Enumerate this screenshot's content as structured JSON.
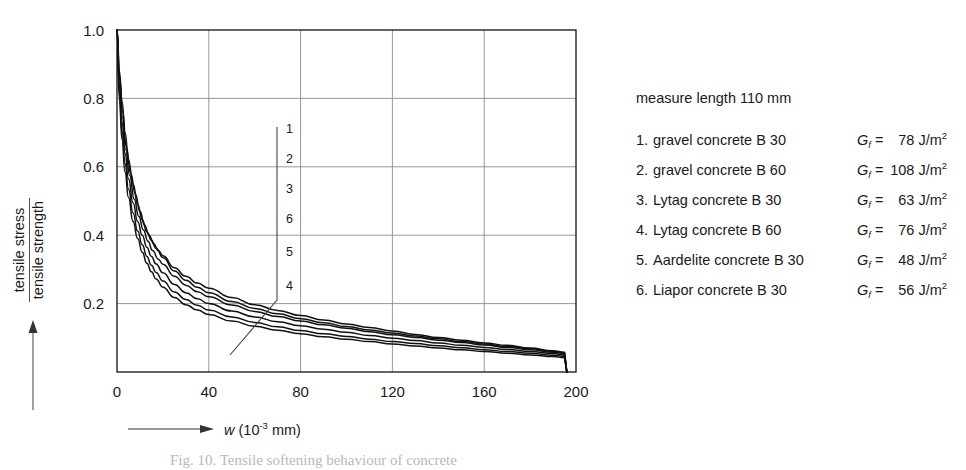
{
  "figure": {
    "caption": "Fig. 10.  Tensile softening behaviour of concrete"
  },
  "legend": {
    "title": "measure length 110 mm",
    "gf_symbol": "G",
    "gf_subscript": "f",
    "gf_equals": "=",
    "gf_unit": "J/m",
    "gf_unit_exponent": "2",
    "items": [
      {
        "index": "1.",
        "label": "gravel concrete B 30",
        "gf": "78"
      },
      {
        "index": "2.",
        "label": "gravel concrete B 60",
        "gf": "108"
      },
      {
        "index": "3.",
        "label": "Lytag concrete B 30",
        "gf": "63"
      },
      {
        "index": "4.",
        "label": "Lytag concrete B 60",
        "gf": "76"
      },
      {
        "index": "5.",
        "label": "Aardelite concrete B 30",
        "gf": "48"
      },
      {
        "index": "6.",
        "label": "Liapor concrete B 30",
        "gf": "56"
      }
    ]
  },
  "axes": {
    "y_label_numerator": "tensile stress",
    "y_label_denominator": "tensile strength",
    "x_label_variable": "w",
    "x_label_unit_open": "(10",
    "x_label_exponent": "-3",
    "x_label_unit_close": " mm)"
  },
  "chart_data": {
    "type": "line",
    "title": "",
    "xlabel": "w (10^-3 mm)",
    "ylabel": "tensile stress / tensile strength",
    "xlim": [
      0,
      200
    ],
    "ylim": [
      0,
      1.0
    ],
    "xticks": [
      0,
      40,
      80,
      120,
      160,
      200
    ],
    "yticks": [
      0.2,
      0.4,
      0.6,
      0.8,
      1.0
    ],
    "ytick_labels": [
      "0.2",
      "0.4",
      "0.6",
      "0.8",
      "1.0"
    ],
    "xtick_labels": [
      "0",
      "40",
      "80",
      "120",
      "160",
      "200"
    ],
    "grid": true,
    "legend_position": "right-outside",
    "line_color": "#111111",
    "grid_color": "#8c8c8c",
    "axis_color": "#111111",
    "curve_callout": {
      "order_top_to_bottom": [
        "1",
        "2",
        "3",
        "6",
        "5",
        "4"
      ],
      "leader_line": "vertical with diagonal foot"
    },
    "series": [
      {
        "name": "1. gravel concrete B 30",
        "points": [
          [
            0,
            1.0
          ],
          [
            1.2,
            0.86
          ],
          [
            2.5,
            0.76
          ],
          [
            4,
            0.66
          ],
          [
            6,
            0.58
          ],
          [
            8,
            0.52
          ],
          [
            10,
            0.47
          ],
          [
            12,
            0.43
          ],
          [
            14,
            0.4
          ],
          [
            16,
            0.375
          ],
          [
            18,
            0.355
          ],
          [
            20,
            0.34
          ],
          [
            25,
            0.305
          ],
          [
            30,
            0.28
          ],
          [
            35,
            0.26
          ],
          [
            40,
            0.245
          ],
          [
            50,
            0.218
          ],
          [
            60,
            0.197
          ],
          [
            70,
            0.18
          ],
          [
            80,
            0.165
          ],
          [
            90,
            0.152
          ],
          [
            100,
            0.14
          ],
          [
            110,
            0.13
          ],
          [
            120,
            0.12
          ],
          [
            130,
            0.11
          ],
          [
            140,
            0.101
          ],
          [
            150,
            0.093
          ],
          [
            160,
            0.085
          ],
          [
            170,
            0.078
          ],
          [
            180,
            0.07
          ],
          [
            190,
            0.062
          ],
          [
            195,
            0.058
          ],
          [
            196,
            0.0
          ]
        ]
      },
      {
        "name": "2. gravel concrete B 60",
        "points": [
          [
            0,
            1.0
          ],
          [
            1,
            0.88
          ],
          [
            2.2,
            0.79
          ],
          [
            3.5,
            0.7
          ],
          [
            5,
            0.62
          ],
          [
            7,
            0.55
          ],
          [
            9,
            0.49
          ],
          [
            11,
            0.445
          ],
          [
            13,
            0.41
          ],
          [
            15,
            0.385
          ],
          [
            17,
            0.362
          ],
          [
            20,
            0.335
          ],
          [
            25,
            0.295
          ],
          [
            30,
            0.268
          ],
          [
            35,
            0.248
          ],
          [
            40,
            0.232
          ],
          [
            50,
            0.206
          ],
          [
            60,
            0.186
          ],
          [
            70,
            0.17
          ],
          [
            80,
            0.156
          ],
          [
            90,
            0.144
          ],
          [
            100,
            0.133
          ],
          [
            110,
            0.123
          ],
          [
            120,
            0.114
          ],
          [
            130,
            0.105
          ],
          [
            140,
            0.097
          ],
          [
            150,
            0.089
          ],
          [
            160,
            0.082
          ],
          [
            170,
            0.075
          ],
          [
            180,
            0.068
          ],
          [
            190,
            0.06
          ],
          [
            195,
            0.056
          ],
          [
            196,
            0.0
          ]
        ]
      },
      {
        "name": "3. Lytag concrete B 30",
        "points": [
          [
            0,
            1.0
          ],
          [
            1,
            0.84
          ],
          [
            2.2,
            0.73
          ],
          [
            3.5,
            0.64
          ],
          [
            5,
            0.565
          ],
          [
            7,
            0.495
          ],
          [
            9,
            0.44
          ],
          [
            11,
            0.4
          ],
          [
            13,
            0.365
          ],
          [
            15,
            0.338
          ],
          [
            17,
            0.316
          ],
          [
            20,
            0.29
          ],
          [
            25,
            0.256
          ],
          [
            30,
            0.232
          ],
          [
            35,
            0.214
          ],
          [
            40,
            0.2
          ],
          [
            50,
            0.178
          ],
          [
            60,
            0.161
          ],
          [
            70,
            0.147
          ],
          [
            80,
            0.135
          ],
          [
            90,
            0.125
          ],
          [
            100,
            0.116
          ],
          [
            110,
            0.107
          ],
          [
            120,
            0.099
          ],
          [
            130,
            0.092
          ],
          [
            140,
            0.085
          ],
          [
            150,
            0.078
          ],
          [
            160,
            0.072
          ],
          [
            170,
            0.066
          ],
          [
            180,
            0.06
          ],
          [
            190,
            0.054
          ],
          [
            195,
            0.05
          ],
          [
            196,
            0.0
          ]
        ]
      },
      {
        "name": "4. Lytag concrete B 60",
        "points": [
          [
            0,
            1.0
          ],
          [
            1,
            0.8
          ],
          [
            2.2,
            0.68
          ],
          [
            3.5,
            0.585
          ],
          [
            5,
            0.51
          ],
          [
            7,
            0.44
          ],
          [
            9,
            0.39
          ],
          [
            11,
            0.35
          ],
          [
            13,
            0.318
          ],
          [
            15,
            0.293
          ],
          [
            17,
            0.272
          ],
          [
            20,
            0.248
          ],
          [
            25,
            0.218
          ],
          [
            30,
            0.197
          ],
          [
            35,
            0.181
          ],
          [
            40,
            0.168
          ],
          [
            50,
            0.149
          ],
          [
            60,
            0.134
          ],
          [
            70,
            0.122
          ],
          [
            80,
            0.112
          ],
          [
            90,
            0.103
          ],
          [
            100,
            0.096
          ],
          [
            110,
            0.089
          ],
          [
            120,
            0.082
          ],
          [
            130,
            0.076
          ],
          [
            140,
            0.07
          ],
          [
            150,
            0.065
          ],
          [
            160,
            0.06
          ],
          [
            170,
            0.055
          ],
          [
            180,
            0.05
          ],
          [
            190,
            0.045
          ],
          [
            195,
            0.042
          ],
          [
            196,
            0.0
          ]
        ]
      },
      {
        "name": "5. Aardelite concrete B 30",
        "points": [
          [
            0,
            1.0
          ],
          [
            1,
            0.82
          ],
          [
            2.2,
            0.705
          ],
          [
            3.5,
            0.61
          ],
          [
            5,
            0.535
          ],
          [
            7,
            0.465
          ],
          [
            9,
            0.412
          ],
          [
            11,
            0.372
          ],
          [
            13,
            0.338
          ],
          [
            15,
            0.312
          ],
          [
            17,
            0.291
          ],
          [
            20,
            0.266
          ],
          [
            25,
            0.234
          ],
          [
            30,
            0.212
          ],
          [
            35,
            0.195
          ],
          [
            40,
            0.181
          ],
          [
            50,
            0.161
          ],
          [
            60,
            0.145
          ],
          [
            70,
            0.132
          ],
          [
            80,
            0.121
          ],
          [
            90,
            0.112
          ],
          [
            100,
            0.104
          ],
          [
            110,
            0.096
          ],
          [
            120,
            0.089
          ],
          [
            130,
            0.083
          ],
          [
            140,
            0.077
          ],
          [
            150,
            0.071
          ],
          [
            160,
            0.065
          ],
          [
            170,
            0.06
          ],
          [
            180,
            0.055
          ],
          [
            190,
            0.049
          ],
          [
            195,
            0.046
          ],
          [
            196,
            0.0
          ]
        ]
      },
      {
        "name": "6. Liapor concrete B 30",
        "points": [
          [
            0,
            1.0
          ],
          [
            1.1,
            0.855
          ],
          [
            2.4,
            0.745
          ],
          [
            3.8,
            0.65
          ],
          [
            5.5,
            0.575
          ],
          [
            7.5,
            0.505
          ],
          [
            9.5,
            0.455
          ],
          [
            11.5,
            0.415
          ],
          [
            13.5,
            0.382
          ],
          [
            15.5,
            0.355
          ],
          [
            18,
            0.33
          ],
          [
            20,
            0.315
          ],
          [
            25,
            0.28
          ],
          [
            30,
            0.254
          ],
          [
            35,
            0.235
          ],
          [
            40,
            0.22
          ],
          [
            50,
            0.196
          ],
          [
            60,
            0.177
          ],
          [
            70,
            0.162
          ],
          [
            80,
            0.149
          ],
          [
            90,
            0.138
          ],
          [
            100,
            0.128
          ],
          [
            110,
            0.118
          ],
          [
            120,
            0.109
          ],
          [
            130,
            0.101
          ],
          [
            140,
            0.093
          ],
          [
            150,
            0.086
          ],
          [
            160,
            0.079
          ],
          [
            170,
            0.072
          ],
          [
            180,
            0.065
          ],
          [
            190,
            0.058
          ],
          [
            195,
            0.054
          ],
          [
            196,
            0.0
          ]
        ]
      }
    ]
  }
}
